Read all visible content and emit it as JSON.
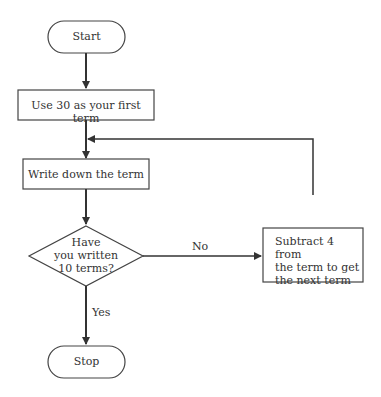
{
  "flowchart": {
    "start": "Start",
    "step1": "Use 30 as your first term",
    "step2": "Write down the term",
    "decision": [
      "Have",
      "you written",
      "10 terms?"
    ],
    "no_label": "No",
    "yes_label": "Yes",
    "subtract": [
      "Subtract 4 from",
      "the term to get",
      "the next term"
    ],
    "stop": "Stop"
  },
  "colors": {
    "stroke": "#444444",
    "text": "#333333",
    "background": "#ffffff"
  }
}
